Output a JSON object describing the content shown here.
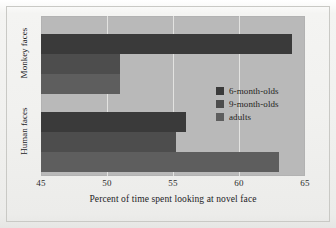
{
  "chart_data": {
    "type": "bar",
    "orientation": "horizontal",
    "title": "",
    "xlabel": "Percent of time spent looking at novel face",
    "ylabel": "",
    "categories": [
      "Monkey faces",
      "Human faces"
    ],
    "series": [
      {
        "name": "6-month-olds",
        "color": "#3a3a3a",
        "values": [
          64.0,
          56.0
        ]
      },
      {
        "name": "9-month-olds",
        "color": "#4d4d4d",
        "values": [
          51.0,
          55.2
        ]
      },
      {
        "name": "adults",
        "color": "#5e5e5e",
        "values": [
          51.0,
          63.0
        ]
      }
    ],
    "xlim": [
      45,
      65
    ],
    "xticks": [
      45,
      50,
      55,
      60,
      65
    ],
    "xtick_labels": [
      "45",
      "50",
      "55",
      "60",
      "65"
    ],
    "gridlines": [
      50,
      55,
      60
    ],
    "grid": true,
    "legend_position": "center-right",
    "plot_background": "#b9b9b9",
    "page_background": "#f1f1ef",
    "gridline_color": "#e3e3e1"
  },
  "legend": {
    "items": [
      {
        "label": "6-month-olds"
      },
      {
        "label": "9-month-olds"
      },
      {
        "label": "adults"
      }
    ]
  }
}
